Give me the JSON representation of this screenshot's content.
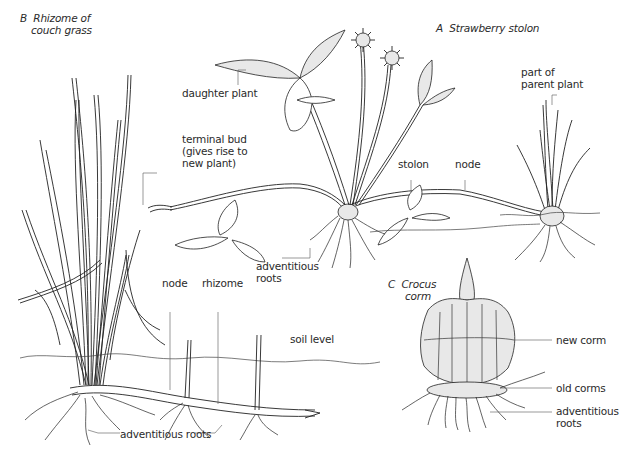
{
  "figure": {
    "panels": [
      {
        "id": "A",
        "title_letter": "A",
        "title": "Strawberry stolon",
        "labels": {
          "daughter_plant": "daughter plant",
          "terminal_bud_1": "terminal bud",
          "terminal_bud_2": "(gives rise to",
          "terminal_bud_3": "new plant)",
          "stolon": "stolon",
          "node": "node",
          "parent_1": "part of",
          "parent_2": "parent plant",
          "adv_roots_1": "adventitious",
          "adv_roots_2": "roots"
        }
      },
      {
        "id": "B",
        "title_letter": "B",
        "title_line1": "Rhizome of",
        "title_line2": "couch grass",
        "labels": {
          "node": "node",
          "rhizome": "rhizome",
          "soil_level": "soil level",
          "adv_roots": "adventitious roots"
        }
      },
      {
        "id": "C",
        "title_letter": "C",
        "title_line1": "Crocus",
        "title_line2": "corm",
        "labels": {
          "new_corm": "new corm",
          "old_corms": "old corms",
          "adv_roots_1": "adventitious",
          "adv_roots_2": "roots"
        }
      }
    ]
  }
}
